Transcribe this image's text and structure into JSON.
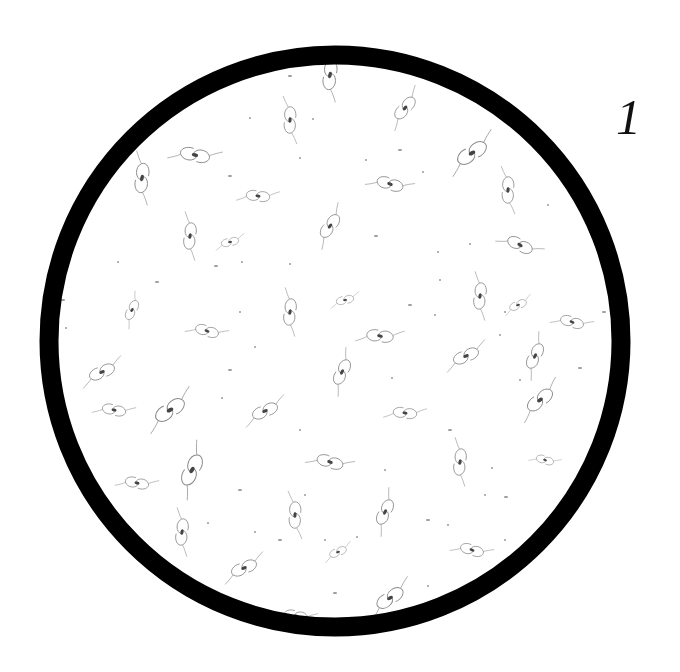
{
  "figure": {
    "panel_label": "1",
    "background": "#ffffff",
    "ring": {
      "cx": 335,
      "cy": 341,
      "r": 286,
      "stroke_width": 19,
      "color": "#000000"
    },
    "galaxy_color": "#808080",
    "core_color": "#444444",
    "galaxies": [
      {
        "x": 330,
        "y": 75,
        "rot": 100,
        "s": 1.0
      },
      {
        "x": 405,
        "y": 108,
        "rot": 135,
        "s": 0.9
      },
      {
        "x": 290,
        "y": 120,
        "rot": 95,
        "s": 0.9
      },
      {
        "x": 195,
        "y": 155,
        "rot": 15,
        "s": 1.0
      },
      {
        "x": 142,
        "y": 178,
        "rot": 100,
        "s": 1.0
      },
      {
        "x": 472,
        "y": 153,
        "rot": 150,
        "s": 1.1
      },
      {
        "x": 390,
        "y": 184,
        "rot": 20,
        "s": 0.9
      },
      {
        "x": 508,
        "y": 190,
        "rot": 95,
        "s": 0.9
      },
      {
        "x": 258,
        "y": 196,
        "rot": 10,
        "s": 0.8
      },
      {
        "x": 190,
        "y": 236,
        "rot": 100,
        "s": 0.9
      },
      {
        "x": 330,
        "y": 226,
        "rot": 130,
        "s": 0.9
      },
      {
        "x": 230,
        "y": 242,
        "rot": 170,
        "s": 0.6
      },
      {
        "x": 520,
        "y": 245,
        "rot": 30,
        "s": 0.9
      },
      {
        "x": 132,
        "y": 310,
        "rot": 120,
        "s": 0.7
      },
      {
        "x": 290,
        "y": 312,
        "rot": 100,
        "s": 0.9
      },
      {
        "x": 345,
        "y": 300,
        "rot": 170,
        "s": 0.6
      },
      {
        "x": 207,
        "y": 331,
        "rot": 20,
        "s": 0.8
      },
      {
        "x": 380,
        "y": 336,
        "rot": 10,
        "s": 0.9
      },
      {
        "x": 480,
        "y": 296,
        "rot": 100,
        "s": 0.9
      },
      {
        "x": 518,
        "y": 305,
        "rot": 160,
        "s": 0.6
      },
      {
        "x": 572,
        "y": 322,
        "rot": 20,
        "s": 0.8
      },
      {
        "x": 535,
        "y": 356,
        "rot": 120,
        "s": 0.9
      },
      {
        "x": 466,
        "y": 356,
        "rot": 160,
        "s": 0.9
      },
      {
        "x": 342,
        "y": 372,
        "rot": 120,
        "s": 0.9
      },
      {
        "x": 102,
        "y": 372,
        "rot": 160,
        "s": 0.9
      },
      {
        "x": 114,
        "y": 410,
        "rot": 15,
        "s": 0.8
      },
      {
        "x": 170,
        "y": 410,
        "rot": 150,
        "s": 1.1
      },
      {
        "x": 265,
        "y": 411,
        "rot": 160,
        "s": 0.9
      },
      {
        "x": 405,
        "y": 413,
        "rot": 10,
        "s": 0.8
      },
      {
        "x": 540,
        "y": 400,
        "rot": 145,
        "s": 1.0
      },
      {
        "x": 330,
        "y": 462,
        "rot": 20,
        "s": 0.9
      },
      {
        "x": 460,
        "y": 462,
        "rot": 100,
        "s": 0.9
      },
      {
        "x": 137,
        "y": 483,
        "rot": 15,
        "s": 0.8
      },
      {
        "x": 192,
        "y": 470,
        "rot": 120,
        "s": 1.1
      },
      {
        "x": 545,
        "y": 460,
        "rot": 20,
        "s": 0.6
      },
      {
        "x": 385,
        "y": 512,
        "rot": 120,
        "s": 0.9
      },
      {
        "x": 295,
        "y": 515,
        "rot": 95,
        "s": 0.9
      },
      {
        "x": 182,
        "y": 532,
        "rot": 100,
        "s": 0.9
      },
      {
        "x": 244,
        "y": 568,
        "rot": 160,
        "s": 0.9
      },
      {
        "x": 338,
        "y": 552,
        "rot": 160,
        "s": 0.6
      },
      {
        "x": 472,
        "y": 550,
        "rot": 20,
        "s": 0.8
      },
      {
        "x": 390,
        "y": 598,
        "rot": 150,
        "s": 1.0
      },
      {
        "x": 296,
        "y": 616,
        "rot": 15,
        "s": 0.8
      }
    ],
    "specks": [
      {
        "x": 290,
        "y": 76
      },
      {
        "x": 250,
        "y": 118
      },
      {
        "x": 313,
        "y": 119
      },
      {
        "x": 400,
        "y": 150
      },
      {
        "x": 366,
        "y": 160
      },
      {
        "x": 423,
        "y": 172
      },
      {
        "x": 230,
        "y": 176
      },
      {
        "x": 300,
        "y": 158
      },
      {
        "x": 548,
        "y": 205
      },
      {
        "x": 376,
        "y": 236
      },
      {
        "x": 438,
        "y": 252
      },
      {
        "x": 470,
        "y": 244
      },
      {
        "x": 216,
        "y": 266
      },
      {
        "x": 242,
        "y": 262
      },
      {
        "x": 118,
        "y": 262
      },
      {
        "x": 157,
        "y": 282
      },
      {
        "x": 290,
        "y": 264
      },
      {
        "x": 440,
        "y": 280
      },
      {
        "x": 63,
        "y": 300
      },
      {
        "x": 66,
        "y": 328
      },
      {
        "x": 240,
        "y": 312
      },
      {
        "x": 410,
        "y": 305
      },
      {
        "x": 435,
        "y": 315
      },
      {
        "x": 505,
        "y": 312
      },
      {
        "x": 604,
        "y": 312
      },
      {
        "x": 500,
        "y": 335
      },
      {
        "x": 255,
        "y": 347
      },
      {
        "x": 230,
        "y": 370
      },
      {
        "x": 392,
        "y": 378
      },
      {
        "x": 520,
        "y": 380
      },
      {
        "x": 580,
        "y": 368
      },
      {
        "x": 222,
        "y": 398
      },
      {
        "x": 300,
        "y": 430
      },
      {
        "x": 450,
        "y": 430
      },
      {
        "x": 385,
        "y": 470
      },
      {
        "x": 492,
        "y": 468
      },
      {
        "x": 240,
        "y": 490
      },
      {
        "x": 305,
        "y": 495
      },
      {
        "x": 485,
        "y": 495
      },
      {
        "x": 506,
        "y": 497
      },
      {
        "x": 208,
        "y": 523
      },
      {
        "x": 255,
        "y": 532
      },
      {
        "x": 280,
        "y": 540
      },
      {
        "x": 325,
        "y": 540
      },
      {
        "x": 357,
        "y": 537
      },
      {
        "x": 428,
        "y": 520
      },
      {
        "x": 448,
        "y": 525
      },
      {
        "x": 505,
        "y": 540
      },
      {
        "x": 335,
        "y": 593
      },
      {
        "x": 428,
        "y": 586
      }
    ]
  }
}
